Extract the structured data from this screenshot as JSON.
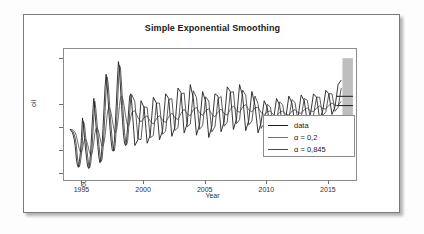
{
  "chart_data": {
    "type": "line",
    "title": "Simple Exponential Smoothing",
    "xlabel": "Year",
    "ylabel": "oil",
    "xlim": [
      1993.5,
      2017.2
    ],
    "ylim": [
      5750,
      11450
    ],
    "xticks": [
      1995,
      2000,
      2005,
      2010,
      2015
    ],
    "yticks": [
      6000,
      7000,
      8000,
      9000,
      11000
    ],
    "grid": false,
    "legend_position": "bottom-right",
    "legend": [
      {
        "label": "data",
        "color": "#1f1f1f",
        "alpha": null
      },
      {
        "label": "α = 0,2",
        "color": "#6e6e6e",
        "alpha": 0.2
      },
      {
        "label": "α = 0,845",
        "color": "#4a4a4a",
        "alpha": 0.845
      }
    ],
    "forecast": {
      "band_color": "#b3b3b3",
      "band_start_year": 2016.1,
      "band_end_year": 2016.95,
      "band_low": 7600,
      "band_high": 11050,
      "lines": [
        9390,
        8990
      ]
    },
    "series": [
      {
        "name": "data",
        "color": "#1f1f1f",
        "x": [
          1994.0,
          1994.083,
          1994.167,
          1994.25,
          1994.333,
          1994.417,
          1994.5,
          1994.583,
          1994.667,
          1994.75,
          1994.833,
          1994.917,
          1995.0,
          1995.083,
          1995.167,
          1995.25,
          1995.333,
          1995.417,
          1995.5,
          1995.583,
          1995.667,
          1995.75,
          1995.833,
          1995.917,
          1996.0,
          1996.083,
          1996.167,
          1996.25,
          1996.333,
          1996.417,
          1996.5,
          1996.583,
          1996.667,
          1996.75,
          1996.833,
          1996.917,
          1997.0,
          1997.083,
          1997.167,
          1997.25,
          1997.333,
          1997.417,
          1997.5,
          1997.583,
          1997.667,
          1997.75,
          1997.833,
          1997.917,
          1998.0,
          1998.083,
          1998.167,
          1998.25,
          1998.333,
          1998.417,
          1998.5,
          1998.583,
          1998.667,
          1998.75,
          1998.833,
          1998.917,
          1999.0,
          1999.25,
          1999.5,
          1999.75,
          2000.0,
          2000.25,
          2000.5,
          2000.75,
          2001.0,
          2001.25,
          2001.5,
          2001.75,
          2002.0,
          2002.25,
          2002.5,
          2002.75,
          2003.0,
          2003.25,
          2003.5,
          2003.75,
          2004.0,
          2004.25,
          2004.5,
          2004.75,
          2005.0,
          2005.25,
          2005.5,
          2005.75,
          2006.0,
          2006.25,
          2006.5,
          2006.75,
          2007.0,
          2007.25,
          2007.5,
          2007.75,
          2008.0,
          2008.25,
          2008.5,
          2008.75,
          2009.0,
          2009.25,
          2009.5,
          2009.75,
          2010.0,
          2010.25,
          2010.5,
          2010.75,
          2011.0,
          2011.25,
          2011.5,
          2011.75,
          2012.0,
          2012.25,
          2012.5,
          2012.75,
          2013.0,
          2013.25,
          2013.5,
          2013.75,
          2014.0,
          2014.25,
          2014.5,
          2014.75,
          2015.0,
          2015.25,
          2015.5,
          2015.75,
          2016.0
        ],
        "y": [
          7950,
          7880,
          7830,
          7700,
          7520,
          7200,
          6700,
          6400,
          6300,
          6550,
          6950,
          7600,
          8450,
          8100,
          7600,
          7100,
          6700,
          6350,
          6250,
          6500,
          7000,
          7800,
          8650,
          9300,
          8800,
          8200,
          7700,
          7200,
          6750,
          6500,
          6650,
          7200,
          8000,
          8900,
          9800,
          10350,
          9900,
          9200,
          8500,
          7900,
          7400,
          7050,
          7000,
          7400,
          8200,
          9100,
          10100,
          10900,
          10600,
          9800,
          9000,
          8300,
          7700,
          7350,
          7250,
          7500,
          8100,
          8800,
          9400,
          9500,
          9100,
          7250,
          7500,
          9200,
          8900,
          7350,
          7700,
          9350,
          9100,
          7500,
          7900,
          9500,
          9300,
          7650,
          8050,
          9750,
          9550,
          7800,
          8200,
          9900,
          9300,
          7700,
          8150,
          9600,
          9150,
          7600,
          8100,
          9500,
          9400,
          7850,
          8300,
          9800,
          9600,
          7950,
          8400,
          9900,
          9400,
          7900,
          8350,
          9600,
          9000,
          7800,
          8250,
          9200,
          8900,
          7900,
          8350,
          9300,
          9000,
          8050,
          8450,
          9400,
          9100,
          8150,
          8500,
          9450,
          9200,
          8250,
          8600,
          9500,
          9350,
          8400,
          8750,
          9650,
          9500,
          8600,
          8950,
          9900,
          10100
        ]
      },
      {
        "name": "α = 0,2",
        "color": "#6e6e6e",
        "description": "Heavily smoothed level; lags the seasonal swings and tracks the slow upward trend."
      },
      {
        "name": "α = 0,845",
        "color": "#4a4a4a",
        "description": "Lightly smoothed level; follows the data closely with a one-step lag."
      }
    ]
  },
  "chart": {
    "title": "Simple Exponential Smoothing",
    "y_axis_title": "oil",
    "x_axis_title": "Year",
    "yticks": [
      "6000",
      "7000",
      "8000",
      "9000",
      "11000"
    ],
    "xticks": [
      "1995",
      "2000",
      "2005",
      "2010",
      "2015"
    ],
    "legend": {
      "item1": "data",
      "item2": "α = 0,2",
      "item3": "α = 0,845"
    }
  }
}
